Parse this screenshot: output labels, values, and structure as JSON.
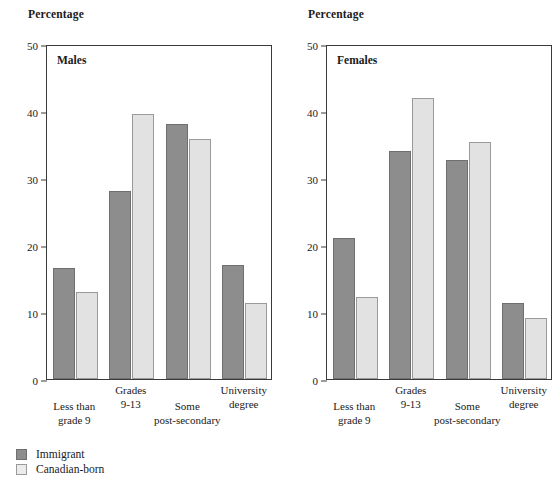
{
  "chart_data": {
    "type": "bar",
    "title": "",
    "ylabel": "Percentage",
    "xlabel": "",
    "ylim": [
      0,
      50
    ],
    "yticks": [
      0,
      10,
      20,
      30,
      40,
      50
    ],
    "grid": false,
    "legend_position": "bottom-left",
    "categories": [
      "Less than grade 9",
      "Grades 9-13",
      "Some post-secondary",
      "University degree"
    ],
    "category_lines": [
      [
        "Less than",
        "grade 9"
      ],
      [
        "Grades",
        "9-13"
      ],
      [
        "Some",
        "post-secondary"
      ],
      [
        "University",
        "degree"
      ]
    ],
    "legend": [
      "Immigrant",
      "Canadian-born"
    ],
    "panels": [
      {
        "label": "Males",
        "axis_title": "Percentage",
        "series": [
          {
            "name": "Immigrant",
            "color": "#8d8d8d",
            "values": [
              16.5,
              28.0,
              38.0,
              17.0
            ]
          },
          {
            "name": "Canadian-born",
            "color": "#e2e2e2",
            "values": [
              13.0,
              39.5,
              35.8,
              11.4
            ]
          }
        ]
      },
      {
        "label": "Females",
        "axis_title": "Percentage",
        "series": [
          {
            "name": "Immigrant",
            "color": "#8d8d8d",
            "values": [
              21.0,
              34.0,
              32.7,
              11.3
            ]
          },
          {
            "name": "Canadian-born",
            "color": "#e2e2e2",
            "values": [
              12.3,
              42.0,
              35.4,
              9.1
            ]
          }
        ]
      }
    ]
  },
  "colors": {
    "immigrant": "#8d8d8d",
    "canadian_born": "#e2e2e2",
    "axis": "#3a3a3a",
    "background": "#ffffff"
  }
}
